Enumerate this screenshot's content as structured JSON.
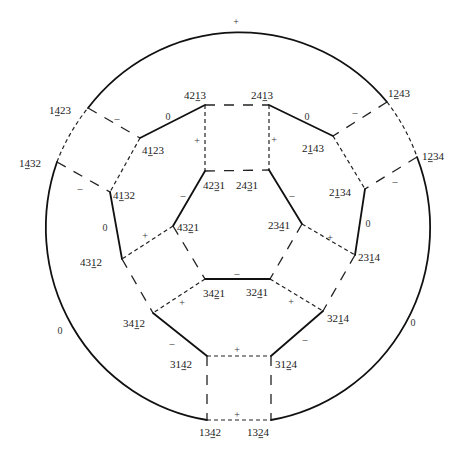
{
  "diagram": {
    "colors": {
      "line": "#111111",
      "text": "#1a1a1a",
      "background": "#ffffff"
    },
    "outer_ellipse": {
      "cx": 238,
      "cy": 225,
      "rx": 192,
      "ry": 195
    },
    "nodes": [
      {
        "id": "1423",
        "text": "1423",
        "underline": 1,
        "x": 88,
        "y": 108,
        "lx": 60,
        "ly": 110
      },
      {
        "id": "1432",
        "text": "1432",
        "underline": 1,
        "x": 57,
        "y": 162,
        "lx": 30,
        "ly": 163
      },
      {
        "id": "1243",
        "text": "1243",
        "underline": 1,
        "x": 387,
        "y": 102,
        "lx": 399,
        "ly": 93
      },
      {
        "id": "1234",
        "text": "1234",
        "underline": 1,
        "x": 417,
        "y": 157,
        "lx": 433,
        "ly": 156
      },
      {
        "id": "4213",
        "text": "4213",
        "underline": 2,
        "x": 205,
        "y": 105,
        "lx": 195,
        "ly": 95
      },
      {
        "id": "2413",
        "text": "2413",
        "underline": 2,
        "x": 269,
        "y": 105,
        "lx": 262,
        "ly": 95
      },
      {
        "id": "4123",
        "text": "4123",
        "underline": 1,
        "x": 140,
        "y": 138,
        "lx": 153,
        "ly": 150
      },
      {
        "id": "2143",
        "text": "2143",
        "underline": 1,
        "x": 333,
        "y": 136,
        "lx": 313,
        "ly": 148
      },
      {
        "id": "4231",
        "text": "4231",
        "underline": 2,
        "x": 205,
        "y": 171,
        "lx": 214,
        "ly": 185
      },
      {
        "id": "2431",
        "text": "2431",
        "underline": 2,
        "x": 269,
        "y": 170,
        "lx": 247,
        "ly": 185
      },
      {
        "id": "4132",
        "text": "4132",
        "underline": 1,
        "x": 110,
        "y": 192,
        "lx": 124,
        "ly": 195
      },
      {
        "id": "2134",
        "text": "2134",
        "underline": 1,
        "x": 365,
        "y": 189,
        "lx": 340,
        "ly": 192
      },
      {
        "id": "4321",
        "text": "4321",
        "underline": 2,
        "x": 173,
        "y": 226,
        "lx": 188,
        "ly": 227
      },
      {
        "id": "2341",
        "text": "2341",
        "underline": 2,
        "x": 302,
        "y": 224,
        "lx": 279,
        "ly": 225
      },
      {
        "id": "4312",
        "text": "4312",
        "underline": 2,
        "x": 122,
        "y": 259,
        "lx": 91,
        "ly": 262
      },
      {
        "id": "2314",
        "text": "2314",
        "underline": 2,
        "x": 355,
        "y": 255,
        "lx": 369,
        "ly": 257
      },
      {
        "id": "3421",
        "text": "3421",
        "underline": 2,
        "x": 205,
        "y": 279,
        "lx": 214,
        "ly": 293
      },
      {
        "id": "3241",
        "text": "3241",
        "underline": 2,
        "x": 270,
        "y": 279,
        "lx": 257,
        "ly": 292
      },
      {
        "id": "3412",
        "text": "3412",
        "underline": 2,
        "x": 153,
        "y": 313,
        "lx": 134,
        "ly": 323
      },
      {
        "id": "3214",
        "text": "3214",
        "underline": 2,
        "x": 323,
        "y": 311,
        "lx": 338,
        "ly": 318
      },
      {
        "id": "3142",
        "text": "3142",
        "underline": 2,
        "x": 207,
        "y": 356,
        "lx": 181,
        "ly": 364
      },
      {
        "id": "3124",
        "text": "3124",
        "underline": 2,
        "x": 271,
        "y": 356,
        "lx": 286,
        "ly": 364
      },
      {
        "id": "1342",
        "text": "1342",
        "underline": 2,
        "x": 207,
        "y": 420,
        "lx": 210,
        "ly": 432
      },
      {
        "id": "1324",
        "text": "1324",
        "underline": 2,
        "x": 271,
        "y": 420,
        "lx": 258,
        "ly": 432
      }
    ],
    "edges": [
      {
        "from": "1432",
        "to": "1423",
        "kind": "arc",
        "style": "short",
        "sign": null
      },
      {
        "from": "1423",
        "to": "1243",
        "kind": "arc",
        "style": "solid",
        "sign": "+",
        "sx": 236,
        "sy": 21
      },
      {
        "from": "1243",
        "to": "1234",
        "kind": "arc",
        "style": "short",
        "sign": null
      },
      {
        "from": "1234",
        "to": "1324",
        "kind": "arc",
        "style": "solid",
        "sign": "0",
        "sx": 413,
        "sy": 322
      },
      {
        "from": "1342",
        "to": "1432",
        "kind": "arc",
        "style": "solid",
        "sign": "0",
        "sx": 60,
        "sy": 330
      },
      {
        "from": "1342",
        "to": "1324",
        "kind": "line",
        "style": "short",
        "sign": "+",
        "sx": 237,
        "sy": 414
      },
      {
        "from": "1423",
        "to": "4123",
        "kind": "line",
        "style": "long",
        "sign": "–",
        "sx": 117,
        "sy": 118
      },
      {
        "from": "1432",
        "to": "4132",
        "kind": "line",
        "style": "long",
        "sign": "–",
        "sx": 80,
        "sy": 188
      },
      {
        "from": "1243",
        "to": "2143",
        "kind": "line",
        "style": "long",
        "sign": "–",
        "sx": 355,
        "sy": 112
      },
      {
        "from": "1234",
        "to": "2134",
        "kind": "line",
        "style": "long",
        "sign": "–",
        "sx": 395,
        "sy": 181
      },
      {
        "from": "4213",
        "to": "2413",
        "kind": "line",
        "style": "long",
        "sign": null
      },
      {
        "from": "4213",
        "to": "4123",
        "kind": "line",
        "style": "solid",
        "sign": "0",
        "sx": 168,
        "sy": 116
      },
      {
        "from": "4213",
        "to": "4231",
        "kind": "line",
        "style": "short",
        "sign": "+",
        "sx": 197,
        "sy": 140
      },
      {
        "from": "2413",
        "to": "2143",
        "kind": "line",
        "style": "solid",
        "sign": "0",
        "sx": 307,
        "sy": 116
      },
      {
        "from": "2413",
        "to": "2431",
        "kind": "line",
        "style": "short",
        "sign": "+",
        "sx": 274,
        "sy": 139
      },
      {
        "from": "4231",
        "to": "2431",
        "kind": "line",
        "style": "long",
        "sign": null
      },
      {
        "from": "4123",
        "to": "4132",
        "kind": "line",
        "style": "short",
        "sign": null
      },
      {
        "from": "2143",
        "to": "2134",
        "kind": "line",
        "style": "short",
        "sign": null
      },
      {
        "from": "4231",
        "to": "4321",
        "kind": "line",
        "style": "solid",
        "sign": "–",
        "sx": 183,
        "sy": 195
      },
      {
        "from": "2431",
        "to": "2341",
        "kind": "line",
        "style": "solid",
        "sign": "–",
        "sx": 292,
        "sy": 195
      },
      {
        "from": "4132",
        "to": "4312",
        "kind": "line",
        "style": "solid",
        "sign": "0",
        "sx": 105,
        "sy": 227
      },
      {
        "from": "2134",
        "to": "2314",
        "kind": "line",
        "style": "solid",
        "sign": "0",
        "sx": 368,
        "sy": 223
      },
      {
        "from": "4321",
        "to": "4312",
        "kind": "line",
        "style": "short",
        "sign": "+",
        "sx": 145,
        "sy": 235
      },
      {
        "from": "2341",
        "to": "2314",
        "kind": "line",
        "style": "short",
        "sign": "+",
        "sx": 330,
        "sy": 237
      },
      {
        "from": "4321",
        "to": "3421",
        "kind": "line",
        "style": "long",
        "sign": null
      },
      {
        "from": "2341",
        "to": "3241",
        "kind": "line",
        "style": "long",
        "sign": null
      },
      {
        "from": "3421",
        "to": "3241",
        "kind": "line",
        "style": "solid",
        "sign": "–",
        "sx": 237,
        "sy": 273
      },
      {
        "from": "4312",
        "to": "3412",
        "kind": "line",
        "style": "long",
        "sign": null
      },
      {
        "from": "2314",
        "to": "3214",
        "kind": "line",
        "style": "long",
        "sign": null
      },
      {
        "from": "3421",
        "to": "3412",
        "kind": "line",
        "style": "short",
        "sign": "+",
        "sx": 182,
        "sy": 302
      },
      {
        "from": "3241",
        "to": "3214",
        "kind": "line",
        "style": "short",
        "sign": "+",
        "sx": 291,
        "sy": 301
      },
      {
        "from": "3412",
        "to": "3142",
        "kind": "line",
        "style": "solid",
        "sign": "–",
        "sx": 172,
        "sy": 343
      },
      {
        "from": "3214",
        "to": "3124",
        "kind": "line",
        "style": "solid",
        "sign": "–",
        "sx": 305,
        "sy": 339
      },
      {
        "from": "3142",
        "to": "3124",
        "kind": "line",
        "style": "short",
        "sign": "+",
        "sx": 237,
        "sy": 349
      },
      {
        "from": "3142",
        "to": "1342",
        "kind": "line",
        "style": "long",
        "sign": null
      },
      {
        "from": "3124",
        "to": "1324",
        "kind": "line",
        "style": "long",
        "sign": null
      }
    ]
  }
}
